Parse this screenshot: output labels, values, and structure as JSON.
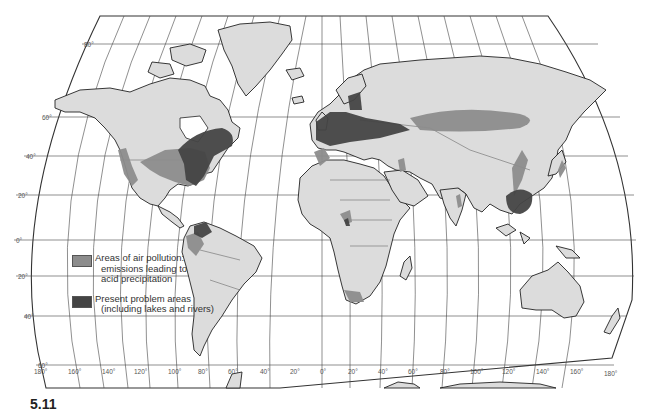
{
  "map": {
    "type": "world map",
    "projection": "Robinson-like, grid every 20 degrees",
    "latitude_labels": [
      "80°",
      "60°",
      "40°",
      "20°",
      "0°",
      "20°",
      "40°",
      "60°"
    ],
    "longitude_labels": [
      "180°",
      "160°",
      "140°",
      "120°",
      "100°",
      "80°",
      "60°",
      "40°",
      "20°",
      "0°",
      "20°",
      "40°",
      "60°",
      "80°",
      "100°",
      "120°",
      "140°",
      "160°",
      "180°"
    ],
    "colors": {
      "land": "#dcdcdc",
      "air_pollution": "#8c8c8c",
      "problem_areas": "#444444",
      "ocean": "#ffffff"
    }
  },
  "legend": {
    "items": [
      {
        "key": "air_pollution",
        "color": "#8c8c8c",
        "line1": "Areas of air pollution:",
        "line2": "emissions leading to",
        "line3": "acid precipitation"
      },
      {
        "key": "problem_areas",
        "color": "#444444",
        "line1": "Present problem areas",
        "line2": "(including lakes and rivers)"
      }
    ]
  },
  "figure_label": "5.11"
}
